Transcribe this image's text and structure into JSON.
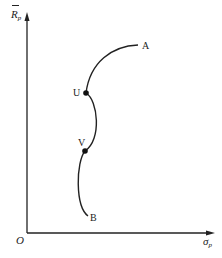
{
  "diagram": {
    "y_axis_label": "R",
    "y_axis_subscript": "p",
    "x_axis_label": "σ",
    "x_axis_subscript": "p",
    "origin_label": "O",
    "points": {
      "A": "A",
      "U": "U",
      "V": "V",
      "B": "B"
    },
    "colors": {
      "line": "#222222",
      "background": "#ffffff"
    }
  }
}
